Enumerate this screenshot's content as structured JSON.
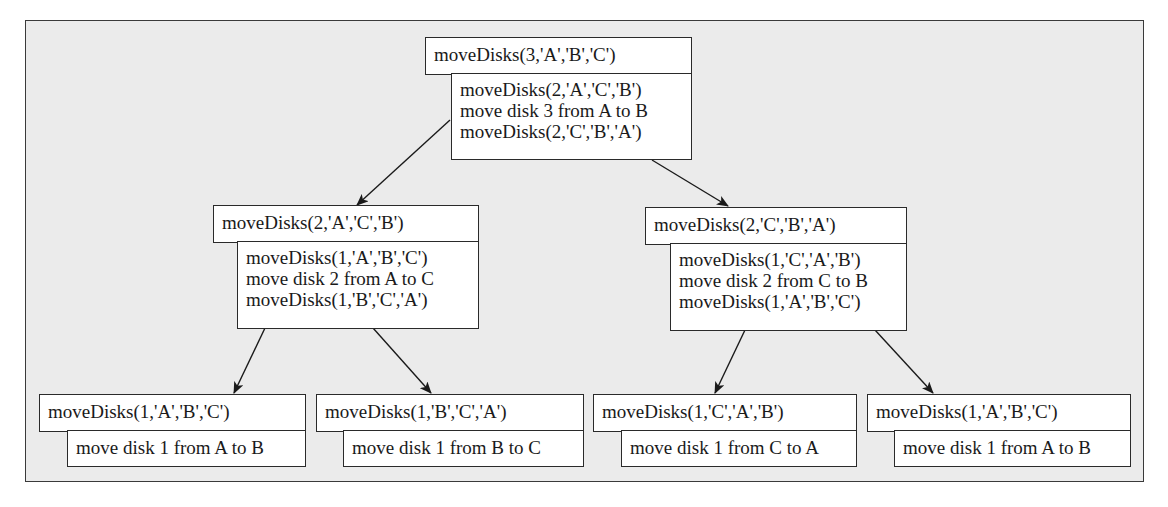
{
  "diagram": {
    "nodes": [
      {
        "id": "root",
        "call": "moveDisks(3,'A','B','C')",
        "steps": [
          "moveDisks(2,'A','C','B')",
          "move disk 3 from A to B",
          "moveDisks(2,'C','B','A')"
        ]
      },
      {
        "id": "mid-left",
        "call": "moveDisks(2,'A','C','B')",
        "steps": [
          "moveDisks(1,'A','B','C')",
          "move disk 2 from A to C",
          "moveDisks(1,'B','C','A')"
        ]
      },
      {
        "id": "mid-right",
        "call": "moveDisks(2,'C','B','A')",
        "steps": [
          "moveDisks(1,'C','A','B')",
          "move disk 2 from C to B",
          "moveDisks(1,'A','B','C')"
        ]
      },
      {
        "id": "leaf-1",
        "call": "moveDisks(1,'A','B','C')",
        "steps": [
          "move disk 1 from A to B"
        ]
      },
      {
        "id": "leaf-2",
        "call": "moveDisks(1,'B','C','A')",
        "steps": [
          "move disk 1 from B to C"
        ]
      },
      {
        "id": "leaf-3",
        "call": "moveDisks(1,'C','A','B')",
        "steps": [
          "move disk 1 from C to A"
        ]
      },
      {
        "id": "leaf-4",
        "call": "moveDisks(1,'A','B','C')",
        "steps": [
          "move disk 1 from A to B"
        ]
      }
    ],
    "edges": [
      {
        "from": "root",
        "to": "mid-left"
      },
      {
        "from": "root",
        "to": "mid-right"
      },
      {
        "from": "mid-left",
        "to": "leaf-1"
      },
      {
        "from": "mid-left",
        "to": "leaf-2"
      },
      {
        "from": "mid-right",
        "to": "leaf-3"
      },
      {
        "from": "mid-right",
        "to": "leaf-4"
      }
    ],
    "colors": {
      "background": "#ebebeb",
      "box": "#ffffff",
      "border": "#2a2a2a"
    }
  }
}
